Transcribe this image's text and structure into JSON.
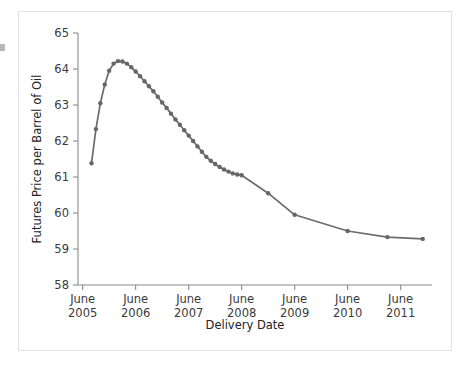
{
  "figure": {
    "frame_color": "#e2e2e2",
    "background_color": "#ffffff"
  },
  "chart_data": {
    "type": "line",
    "title": "",
    "xlabel": "Delivery Date",
    "ylabel": "Futures Price per Barrel of Oil",
    "ylim": [
      58,
      65
    ],
    "ytick_labels": [
      "58",
      "59",
      "60",
      "61",
      "62",
      "63",
      "64",
      "65"
    ],
    "ytick_values": [
      58,
      59,
      60,
      61,
      62,
      63,
      64,
      65
    ],
    "xtick_labels": [
      {
        "month": "June",
        "year": "2005"
      },
      {
        "month": "June",
        "year": "2006"
      },
      {
        "month": "June",
        "year": "2007"
      },
      {
        "month": "June",
        "year": "2008"
      },
      {
        "month": "June",
        "year": "2009"
      },
      {
        "month": "June",
        "year": "2010"
      },
      {
        "month": "June",
        "year": "2011"
      }
    ],
    "xtick_values": [
      2005.458,
      2006.458,
      2007.458,
      2008.458,
      2009.458,
      2010.458,
      2011.458
    ],
    "xlim": [
      2005.37,
      2012.05
    ],
    "grid": false,
    "legend": null,
    "series": [
      {
        "name": "Futures Price per Barrel of Oil",
        "color": "#666666",
        "marker": "circle",
        "x": [
          2005.625,
          2005.708,
          2005.792,
          2005.875,
          2005.958,
          2006.042,
          2006.125,
          2006.208,
          2006.292,
          2006.375,
          2006.458,
          2006.542,
          2006.625,
          2006.708,
          2006.792,
          2006.875,
          2006.958,
          2007.042,
          2007.125,
          2007.208,
          2007.292,
          2007.375,
          2007.458,
          2007.542,
          2007.625,
          2007.708,
          2007.792,
          2007.875,
          2007.958,
          2008.042,
          2008.125,
          2008.208,
          2008.292,
          2008.375,
          2008.458,
          2008.958,
          2009.458,
          2010.458,
          2011.208,
          2011.875
        ],
        "values": [
          61.38,
          62.33,
          63.05,
          63.57,
          63.95,
          64.15,
          64.22,
          64.21,
          64.15,
          64.05,
          63.93,
          63.8,
          63.66,
          63.52,
          63.38,
          63.23,
          63.07,
          62.92,
          62.76,
          62.6,
          62.45,
          62.3,
          62.15,
          62.0,
          61.85,
          61.7,
          61.56,
          61.45,
          61.36,
          61.28,
          61.21,
          61.15,
          61.1,
          61.07,
          61.05,
          60.55,
          59.95,
          59.5,
          59.33,
          59.28
        ]
      }
    ],
    "notes": {
      "peak_value": 64.22,
      "peak_label": "approximately March 2006",
      "first_value": 61.38,
      "last_value": 59.28
    }
  }
}
